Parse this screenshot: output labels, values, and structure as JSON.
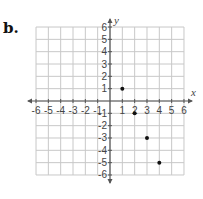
{
  "label": "b.",
  "chart_data": {
    "type": "scatter",
    "title": "",
    "xlabel": "x",
    "ylabel": "y",
    "xlim": [
      -6,
      6
    ],
    "ylim": [
      -6,
      6
    ],
    "grid": true,
    "x_ticks": [
      -6,
      -5,
      -4,
      -3,
      -2,
      -1,
      1,
      2,
      3,
      4,
      5,
      6
    ],
    "y_ticks": [
      6,
      5,
      4,
      3,
      2,
      1,
      -1,
      -2,
      -3,
      -4,
      -5,
      -6
    ],
    "points": [
      {
        "x": 1,
        "y": 1
      },
      {
        "x": 2,
        "y": -1
      },
      {
        "x": 3,
        "y": -3
      },
      {
        "x": 4,
        "y": -5
      }
    ],
    "colors": {
      "grid": "#c8c8c8",
      "axis": "#555555",
      "point": "#111111"
    }
  }
}
